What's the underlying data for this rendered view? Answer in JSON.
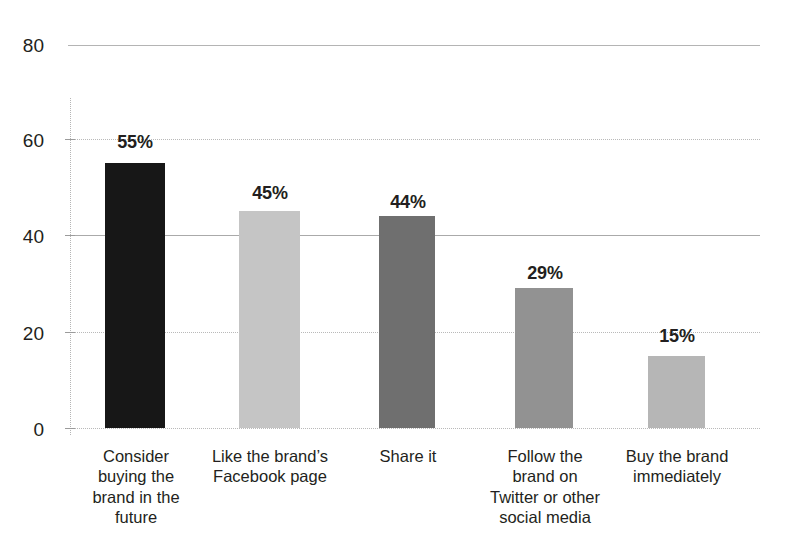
{
  "chart_data": {
    "type": "bar",
    "title": "",
    "subtitle": "",
    "xlabel": "",
    "ylabel": "",
    "ylim": [
      0,
      80
    ],
    "yticks": [
      0,
      20,
      40,
      60,
      80
    ],
    "ytick_labels": [
      "0",
      "20",
      "40",
      "60",
      "80"
    ],
    "grid": true,
    "legend": false,
    "categories": [
      "Consider buying the brand in the future",
      "Like the brand’s Facebook page",
      "Share it",
      "Follow the brand on Twitter or other social media",
      "Buy the brand immediately"
    ],
    "category_lines": [
      [
        "Consider",
        "buying the",
        "brand in the",
        "future"
      ],
      [
        "Like the brand’s",
        "Facebook page"
      ],
      [
        "Share it"
      ],
      [
        "Follow the",
        "brand on",
        "Twitter or other",
        "social media"
      ],
      [
        "Buy the brand",
        "immediately"
      ]
    ],
    "values": [
      55,
      45,
      44,
      29,
      15
    ],
    "data_labels": [
      "55%",
      "45%",
      "44%",
      "29%",
      "15%"
    ],
    "bar_colors": [
      "#171717",
      "#c5c5c5",
      "#6f6f6f",
      "#929292",
      "#b6b6b6"
    ]
  },
  "axis": {
    "grid_color": "#b9b9b9",
    "axis_color": "#b5b5b5",
    "tick_color": "#9b9b9b",
    "text_color": "#231f20",
    "background": "#ffffff"
  }
}
